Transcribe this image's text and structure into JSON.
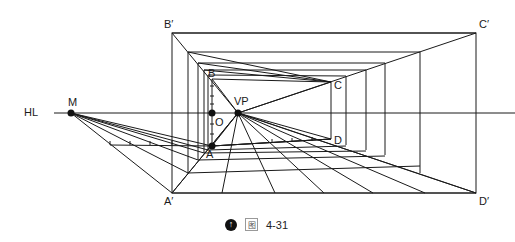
{
  "figure": {
    "caption_icon": "arrow-up-circle-icon",
    "caption_prefix": "图",
    "caption_number": "4-31"
  },
  "labels": {
    "horizon_line": "HL",
    "measuring_point": "M",
    "vanishing_point": "VP",
    "origin": "O",
    "inner_A": "A",
    "inner_B": "B",
    "inner_C": "C",
    "inner_D": "D",
    "outer_A": "A′",
    "outer_B": "B′",
    "outer_C": "C′",
    "outer_D": "D′"
  },
  "colors": {
    "line": "#1a1a1a",
    "background": "#ffffff"
  }
}
